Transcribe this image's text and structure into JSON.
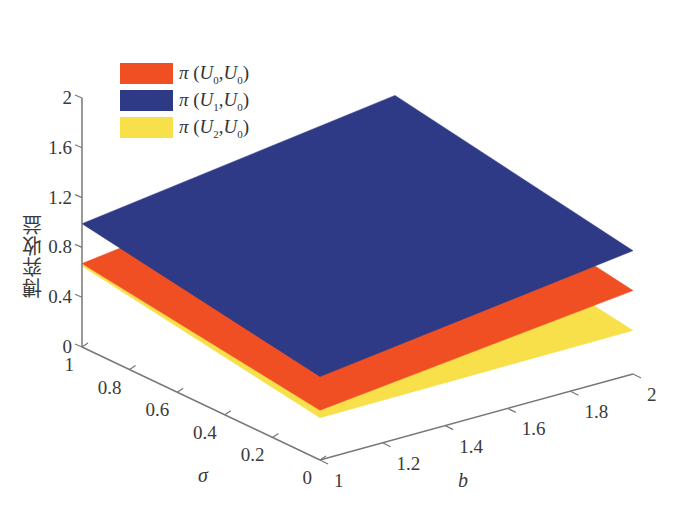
{
  "chart_data": {
    "type": "surface3d",
    "title": "",
    "xlabel": "b",
    "ylabel": "σ",
    "zlabel": "博弈收益",
    "x_ticks": [
      "1",
      "1.2",
      "1.4",
      "1.6",
      "1.8",
      "2"
    ],
    "y_ticks": [
      "0",
      "0.2",
      "0.4",
      "0.6",
      "0.8",
      "1"
    ],
    "z_ticks": [
      "0",
      "0.4",
      "0.8",
      "1.2",
      "1.6",
      "2"
    ],
    "xlim": [
      1,
      2
    ],
    "ylim": [
      0,
      1
    ],
    "zlim": [
      0,
      2
    ],
    "grid": false,
    "legend_position": "upper-left",
    "series": [
      {
        "name": "π (U0,U0)",
        "color": "#f04e23",
        "corners": {
          "b1_s1": 0.67,
          "b2_s1": 1.0,
          "b2_s0": 0.67,
          "b1_s0": 0.4
        }
      },
      {
        "name": "π (U1,U0)",
        "color": "#2e3a86",
        "corners": {
          "b1_s1": 0.99,
          "b2_s1": 1.33,
          "b2_s0": 0.99,
          "b1_s0": 0.67
        }
      },
      {
        "name": "π (U2,U0)",
        "color": "#f7e04a",
        "corners": {
          "b1_s1": 0.65,
          "b2_s1": 0.66,
          "b2_s0": 0.35,
          "b1_s0": 0.34
        }
      }
    ]
  },
  "legend": {
    "items": [
      {
        "pi": "π",
        "open": " (",
        "u1": "U",
        "s1": "0",
        "comma": ",",
        "u2": "U",
        "s2": "0",
        "close": ")",
        "color": "#f04e23"
      },
      {
        "pi": "π",
        "open": " (",
        "u1": "U",
        "s1": "1",
        "comma": ",",
        "u2": "U",
        "s2": "0",
        "close": ")",
        "color": "#2e3a86"
      },
      {
        "pi": "π",
        "open": " (",
        "u1": "U",
        "s1": "2",
        "comma": ",",
        "u2": "U",
        "s2": "0",
        "close": ")",
        "color": "#f7e04a"
      }
    ]
  }
}
